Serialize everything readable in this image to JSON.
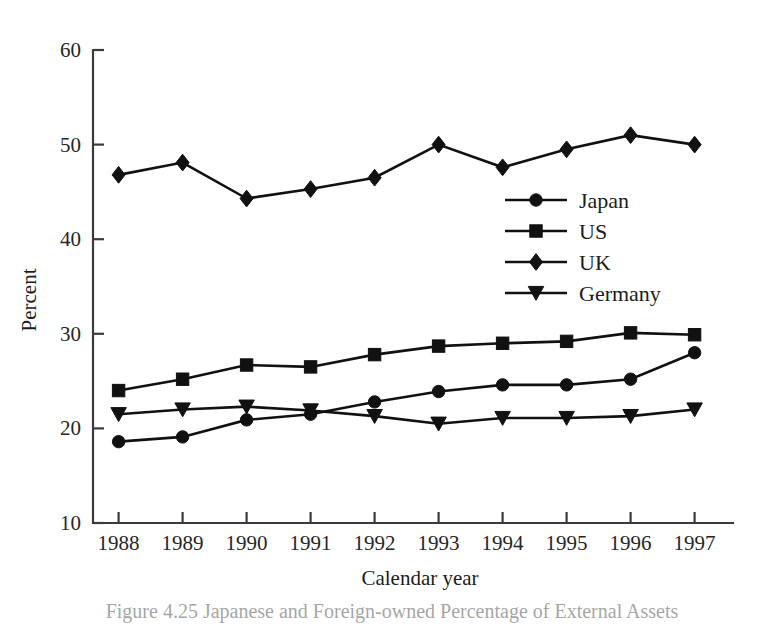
{
  "chart_data": {
    "type": "line",
    "title": "",
    "xlabel": "Calendar year",
    "ylabel": "Percent",
    "x": [
      1988,
      1989,
      1990,
      1991,
      1992,
      1993,
      1994,
      1995,
      1996,
      1997
    ],
    "xtick_labels": [
      "1988",
      "1989",
      "1990",
      "1991",
      "1992",
      "1993",
      "1994",
      "1995",
      "1996",
      "1997"
    ],
    "ytick_labels": [
      "10",
      "20",
      "30",
      "40",
      "50",
      "60"
    ],
    "yticks": [
      10,
      20,
      30,
      40,
      50,
      60
    ],
    "ylim": [
      10,
      60
    ],
    "xlim": [
      1987.6,
      1997.6
    ],
    "grid": false,
    "legend_position": "center-right",
    "series": [
      {
        "name": "Japan",
        "marker": "circle",
        "values": [
          18.6,
          19.1,
          20.9,
          21.5,
          22.8,
          23.9,
          24.6,
          24.6,
          25.2,
          28.0
        ]
      },
      {
        "name": "US",
        "marker": "square",
        "values": [
          24.0,
          25.2,
          26.7,
          26.5,
          27.8,
          28.7,
          29.0,
          29.2,
          30.1,
          29.9
        ]
      },
      {
        "name": "UK",
        "marker": "diamond",
        "values": [
          46.8,
          48.1,
          44.3,
          45.3,
          46.5,
          50.0,
          47.6,
          49.5,
          51.0,
          50.0
        ]
      },
      {
        "name": "Germany",
        "marker": "triangle-down",
        "values": [
          21.5,
          22.0,
          22.3,
          21.9,
          21.3,
          20.5,
          21.1,
          21.1,
          21.3,
          22.0
        ]
      }
    ]
  },
  "caption": {
    "text": "Figure 4.25   Japanese and Foreign-owned Percentage of External Assets"
  }
}
